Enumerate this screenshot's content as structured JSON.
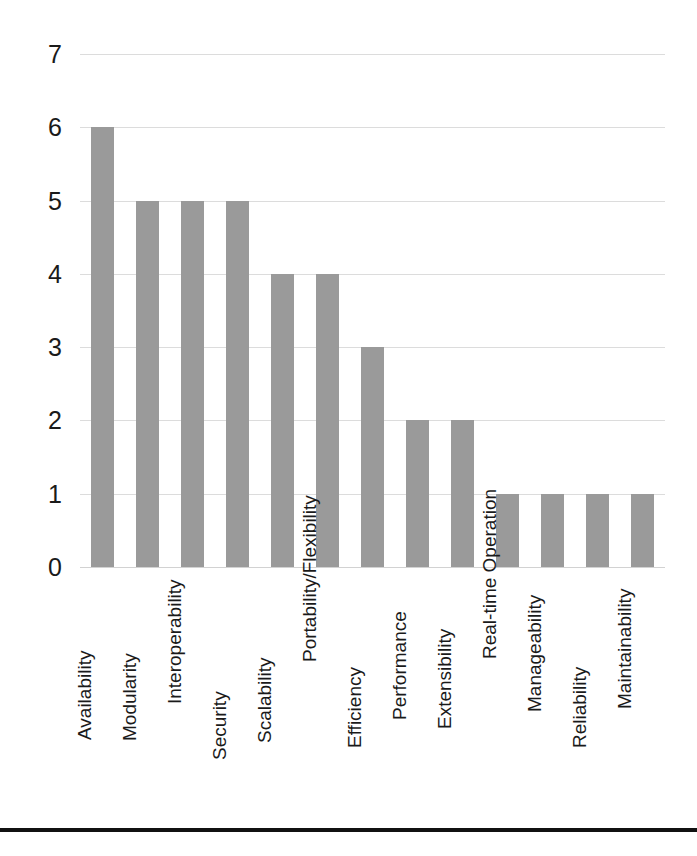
{
  "chart_data": {
    "type": "bar",
    "title": "",
    "subtitle": "",
    "xlabel": "",
    "ylabel": "",
    "ylim": [
      0,
      7
    ],
    "ytick_values": [
      7,
      6,
      5,
      4,
      3,
      2,
      1,
      0
    ],
    "ytick_labels": [
      "7",
      "6",
      "5",
      "4",
      "3",
      "2",
      "1",
      "0"
    ],
    "grid": true,
    "grid_axis": "y",
    "legend": "none",
    "orientation": "vertical",
    "bar_color": "#9a9a9a",
    "grid_color": "#dcdcdc",
    "text_color": "#1a1a1a",
    "background": "#ffffff",
    "categories": [
      "Availability",
      "Modularity",
      "Interoperability",
      "Security",
      "Scalability",
      "Portability/Flexibility",
      "Efficiency",
      "Performance",
      "Extensibility",
      "Real-time Operation",
      "Manageability",
      "Reliability",
      "Maintainability"
    ],
    "values": [
      6,
      5,
      5,
      5,
      4,
      4,
      3,
      2,
      2,
      1,
      1,
      1,
      1
    ],
    "series": [
      {
        "name": "Count",
        "values": [
          6,
          5,
          5,
          5,
          4,
          4,
          3,
          2,
          2,
          1,
          1,
          1,
          1
        ]
      }
    ]
  },
  "figure": {
    "caption": ""
  }
}
